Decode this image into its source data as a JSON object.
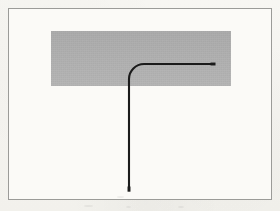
{
  "figure": {
    "canvas": {
      "width": 280,
      "height": 211,
      "background_color": "#f6f5f1"
    },
    "frame": {
      "label": "figure border rule",
      "x": 8,
      "y": 8,
      "width": 264,
      "height": 192,
      "stroke_color": "#9b9b98",
      "stroke_width": 1,
      "fill_color": "#fbfaf7"
    },
    "shaded_region": {
      "label": "gray band",
      "x": 51,
      "y": 31,
      "width": 180,
      "height": 55,
      "fill_color": "#b1b1b1"
    },
    "path": {
      "label": "curved L-shaped line",
      "stroke_color": "#1b1b1b",
      "stroke_width": 2,
      "vertical_x": 129,
      "vertical_bottom_y": 191,
      "arc_start_y": 79,
      "arc_radius": 15,
      "horizontal_y": 64,
      "horizontal_end_x": 215,
      "svg_d": "M 129 191 L 129 79 A 15 15 0 0 1 144 64 L 215 64"
    },
    "endpoints": {
      "bottom_label": "bottom terminus",
      "bottom_x": 129,
      "bottom_y": 191,
      "right_label": "right terminus",
      "right_x": 215,
      "right_y": 64
    }
  }
}
